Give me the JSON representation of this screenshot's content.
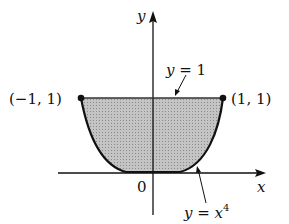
{
  "figure": {
    "axis_labels": {
      "x": "x",
      "y": "y"
    },
    "origin_label": "0",
    "points": [
      {
        "label": "(−1, 1)",
        "x": -1,
        "y": 1
      },
      {
        "label": "(1, 1)",
        "x": 1,
        "y": 1
      }
    ],
    "curves": [
      {
        "label_var": "y",
        "label_eq": " = 1",
        "description": "horizontal line y = 1"
      },
      {
        "label_var": "y",
        "label_eq": " = ",
        "label_base": "x",
        "label_exp": "4",
        "description": "curve y = x^4"
      }
    ],
    "shaded_region": "region between y = x^4 and y = 1 for -1 <= x <= 1",
    "colors": {
      "fill": "#b8b8b8",
      "stroke": "#111111"
    }
  }
}
